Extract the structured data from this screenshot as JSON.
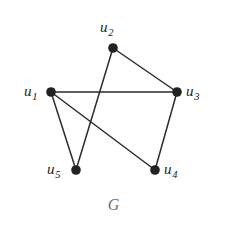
{
  "figure": {
    "caption": "G",
    "caption_color": "#6f6f6f",
    "background_color": "#ffffff",
    "edge_color": "#2b2b2b",
    "vertex_color": "#222222",
    "label_color": "#1c1c1c"
  },
  "chart_data": {
    "type": "diagram",
    "subtype": "undirected-graph",
    "title": "G",
    "vertices": [
      {
        "id": "u1",
        "base": "u",
        "subscript": "1",
        "x": 51,
        "y": 92,
        "label_x": 24,
        "label_y": 84,
        "label_anchor": "left"
      },
      {
        "id": "u2",
        "base": "u",
        "subscript": "2",
        "x": 113,
        "y": 48,
        "label_x": 100,
        "label_y": 20,
        "label_anchor": "above"
      },
      {
        "id": "u3",
        "base": "u",
        "subscript": "3",
        "x": 177,
        "y": 92,
        "label_x": 186,
        "label_y": 84,
        "label_anchor": "right"
      },
      {
        "id": "u4",
        "base": "u",
        "subscript": "4",
        "x": 155,
        "y": 170,
        "label_x": 164,
        "label_y": 162,
        "label_anchor": "right"
      },
      {
        "id": "u5",
        "base": "u",
        "subscript": "5",
        "x": 76,
        "y": 170,
        "label_x": 47,
        "label_y": 162,
        "label_anchor": "left"
      }
    ],
    "edges": [
      {
        "from": "u1",
        "to": "u3"
      },
      {
        "from": "u1",
        "to": "u5"
      },
      {
        "from": "u1",
        "to": "u4"
      },
      {
        "from": "u2",
        "to": "u3"
      },
      {
        "from": "u2",
        "to": "u5"
      },
      {
        "from": "u3",
        "to": "u4"
      }
    ],
    "vertex_radius": 4.8,
    "edge_width": 1.5,
    "vertex_count": 5,
    "edge_count": 6,
    "labels": [
      "u1",
      "u2",
      "u3",
      "u4",
      "u5"
    ]
  }
}
